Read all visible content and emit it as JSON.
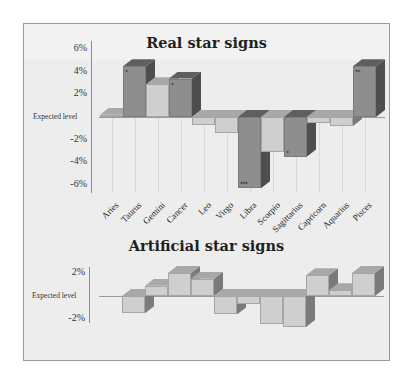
{
  "colors": {
    "background": "#ededed",
    "frame_border": "#9a9a9a",
    "bar_dark_front": "#8e8e8e",
    "bar_dark_side": "#4e4e4e",
    "bar_dark_top": "#5f5f5f",
    "bar_light_front": "#cfcfcf",
    "bar_light_side": "#7a7a7a",
    "bar_light_top": "#a8a8a8"
  },
  "chart_data": [
    {
      "type": "bar",
      "title": "Real star signs",
      "xlabel": "",
      "ylabel": "",
      "baseline_label": "Expected level",
      "y_ticks": [
        "6%",
        "4%",
        "2%",
        "Expected level",
        "-2%",
        "-4%",
        "-6%"
      ],
      "ylim": [
        -6.5,
        6.5
      ],
      "grid": "vertical",
      "style": "3d",
      "categories": [
        "Aries",
        "Taurus",
        "Gemini",
        "Cancer",
        "Leo",
        "Virgo",
        "Libra",
        "Scorpio",
        "Sagittarius",
        "Capricorn",
        "Aquarius",
        "Pisces"
      ],
      "values": [
        0.2,
        4.5,
        2.9,
        3.4,
        -0.7,
        -1.4,
        -6.3,
        -3.1,
        -3.5,
        -0.5,
        -0.8,
        4.5
      ],
      "significance": [
        "",
        "*",
        "",
        "*",
        "",
        "",
        "***",
        "",
        "*",
        "",
        "",
        "**"
      ],
      "shade": [
        "light",
        "dark",
        "light",
        "dark",
        "light",
        "light",
        "dark",
        "light",
        "dark",
        "light",
        "light",
        "dark"
      ]
    },
    {
      "type": "bar",
      "title": "Artificial star signs",
      "xlabel": "",
      "ylabel": "",
      "baseline_label": "Expected level",
      "y_ticks": [
        "2%",
        "Expected level",
        "-2%"
      ],
      "ylim": [
        -3,
        3
      ],
      "style": "3d",
      "categories": [
        "1",
        "2",
        "3",
        "4",
        "5",
        "6",
        "7",
        "8",
        "9",
        "10",
        "11"
      ],
      "values": [
        -1.5,
        0.9,
        2.0,
        1.5,
        -1.6,
        -0.7,
        -2.4,
        -2.7,
        1.8,
        0.5,
        2.0
      ]
    }
  ]
}
